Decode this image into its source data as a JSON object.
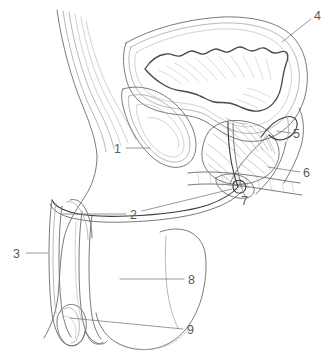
{
  "figure": {
    "background_color": "#ffffff",
    "line_color": "#6b6b6b",
    "label_color": "#5a5a5a",
    "width": 330,
    "height": 359
  },
  "labels": [
    {
      "id": "label-1",
      "number": "1",
      "text_x": 114,
      "text_y": 153,
      "leader": "M 126 148 L 150 148",
      "structure": "symphysis-pubis"
    },
    {
      "id": "label-2",
      "number": "2",
      "text_x": 130,
      "text_y": 219,
      "leader": "M 126 214 L 62 214 M 142 211 L 232 189",
      "structure": "urethra-penile"
    },
    {
      "id": "label-3",
      "number": "3",
      "text_x": 13,
      "text_y": 258,
      "leader": "M 26 253 L 48 253",
      "structure": "corpus-cavernosum"
    },
    {
      "id": "label-4",
      "number": "4",
      "text_x": 314,
      "text_y": 20,
      "leader": "M 311 19 L 282 42",
      "structure": "urinary-bladder"
    },
    {
      "id": "label-5",
      "number": "5",
      "text_x": 293,
      "text_y": 138,
      "leader": "M 291 133 L 277 131",
      "structure": "seminal-vesicle"
    },
    {
      "id": "label-6",
      "number": "6",
      "text_x": 303,
      "text_y": 177,
      "leader": "M 300 172 L 268 167",
      "structure": "rectum"
    },
    {
      "id": "label-7",
      "number": "7",
      "text_x": 241,
      "text_y": 205,
      "leader": "M 245 196 L 239 182",
      "structure": "bulbourethral-gland"
    },
    {
      "id": "label-8",
      "number": "8",
      "text_x": 188,
      "text_y": 284,
      "leader": "M 184 279 L 120 279",
      "structure": "scrotum"
    },
    {
      "id": "label-9",
      "number": "9",
      "text_x": 187,
      "text_y": 334,
      "leader": "M 183 329 L 70 318",
      "structure": "testis"
    }
  ]
}
